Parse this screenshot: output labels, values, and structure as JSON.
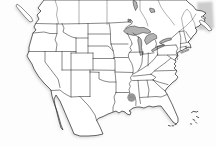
{
  "map": {
    "name": "united-states-outline-map",
    "colors": {
      "background": "#fdfdfd",
      "land": "#ffffff",
      "line": "#262626",
      "water": "#b3b3b3",
      "coastal_water": "#cccccc",
      "shadow": "#c5c5c5"
    },
    "marker": {
      "x": 131.5,
      "y": 97.5,
      "r": 4.2,
      "color": "#8d8d8d"
    }
  }
}
